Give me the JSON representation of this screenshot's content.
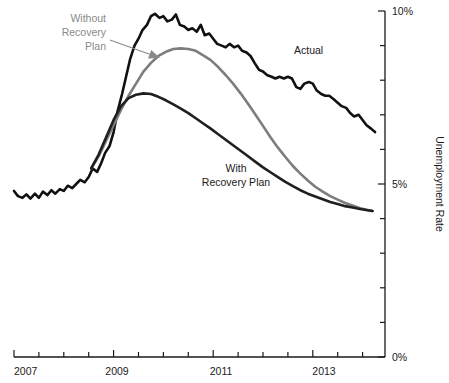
{
  "chart_data": {
    "type": "line",
    "title": "",
    "subtitle": "",
    "xlabel": "",
    "ylabel": "Unemployment Rate",
    "xlim": [
      2007.0,
      2014.45
    ],
    "ylim": [
      0,
      10
    ],
    "grid": false,
    "legend_position": "inline-annotations",
    "y_tick_labels": [
      "0%",
      "5%",
      "10%"
    ],
    "y_ticks_labeled": [
      0,
      5,
      10
    ],
    "y_ticks_minor": [
      1,
      2,
      3,
      4,
      6,
      7,
      8,
      9
    ],
    "x_tick_labels": [
      "2007",
      "2009",
      "2011",
      "2013"
    ],
    "x_ticks_labeled": [
      2007,
      2009,
      2011,
      2013
    ],
    "x_ticks_minor": [
      2007.5,
      2008,
      2008.5,
      2009.5,
      2010,
      2010.5,
      2011.5,
      2012,
      2012.5,
      2013.5,
      2014
    ],
    "series": [
      {
        "name": "Actual",
        "color": "#111111",
        "width": 2.6,
        "label": "Actual",
        "label_x": 2012.1,
        "label_y": 8.9,
        "x": [
          2007.0,
          2007.08,
          2007.17,
          2007.25,
          2007.33,
          2007.42,
          2007.5,
          2007.58,
          2007.67,
          2007.75,
          2007.83,
          2007.92,
          2008.0,
          2008.08,
          2008.17,
          2008.25,
          2008.33,
          2008.42,
          2008.5,
          2008.58,
          2008.67,
          2008.75,
          2008.83,
          2008.92,
          2009.0,
          2009.08,
          2009.17,
          2009.25,
          2009.33,
          2009.42,
          2009.5,
          2009.58,
          2009.67,
          2009.75,
          2009.83,
          2009.92,
          2010.0,
          2010.08,
          2010.17,
          2010.25,
          2010.33,
          2010.42,
          2010.5,
          2010.58,
          2010.67,
          2010.75,
          2010.83,
          2010.92,
          2011.0,
          2011.08,
          2011.17,
          2011.25,
          2011.33,
          2011.42,
          2011.5,
          2011.58,
          2011.67,
          2011.75,
          2011.83,
          2011.92,
          2012.0,
          2012.08,
          2012.17,
          2012.25,
          2012.33,
          2012.42,
          2012.5,
          2012.58,
          2012.67,
          2012.75,
          2012.83,
          2012.92,
          2013.0,
          2013.08,
          2013.17,
          2013.25,
          2013.33,
          2013.42,
          2013.5,
          2013.58,
          2013.67,
          2013.75,
          2013.83,
          2013.92,
          2014.0,
          2014.08,
          2014.17,
          2014.25
        ],
        "y": [
          4.8,
          4.65,
          4.6,
          4.7,
          4.58,
          4.72,
          4.6,
          4.78,
          4.68,
          4.82,
          4.72,
          4.85,
          4.8,
          4.95,
          4.88,
          5.0,
          5.12,
          5.05,
          5.2,
          5.45,
          5.35,
          5.6,
          5.9,
          6.1,
          6.5,
          7.1,
          7.6,
          8.1,
          8.6,
          9.0,
          9.2,
          9.45,
          9.6,
          9.85,
          9.92,
          9.8,
          9.85,
          9.7,
          9.75,
          9.9,
          9.6,
          9.55,
          9.45,
          9.5,
          9.4,
          9.6,
          9.3,
          9.35,
          9.2,
          9.05,
          9.0,
          8.95,
          9.05,
          8.95,
          9.0,
          8.85,
          8.8,
          8.7,
          8.5,
          8.3,
          8.25,
          8.15,
          8.1,
          8.05,
          8.1,
          8.05,
          8.1,
          8.05,
          7.8,
          7.75,
          7.9,
          7.95,
          7.9,
          7.7,
          7.6,
          7.55,
          7.55,
          7.45,
          7.35,
          7.25,
          7.2,
          7.05,
          6.95,
          7.0,
          6.85,
          6.7,
          6.6,
          6.5
        ]
      },
      {
        "name": "Without Recovery Plan",
        "color": "#7d7d7d",
        "width": 2.6,
        "label": "Without\nRecovery\nPlan",
        "label_lines": [
          "Without",
          "Recovery",
          "Plan"
        ],
        "x": [
          2008.55,
          2008.7,
          2008.85,
          2009.0,
          2009.15,
          2009.3,
          2009.45,
          2009.6,
          2009.75,
          2009.9,
          2010.05,
          2010.2,
          2010.35,
          2010.5,
          2010.65,
          2010.8,
          2010.95,
          2011.1,
          2011.25,
          2011.4,
          2011.55,
          2011.7,
          2011.85,
          2012.0,
          2012.15,
          2012.3,
          2012.45,
          2012.6,
          2012.75,
          2012.9,
          2013.05,
          2013.2,
          2013.35,
          2013.5,
          2013.65,
          2013.8,
          2013.95,
          2014.1,
          2014.2
        ],
        "y": [
          5.45,
          5.8,
          6.25,
          6.7,
          7.15,
          7.55,
          7.9,
          8.25,
          8.5,
          8.7,
          8.82,
          8.9,
          8.92,
          8.9,
          8.85,
          8.72,
          8.58,
          8.38,
          8.15,
          7.9,
          7.62,
          7.32,
          7.0,
          6.68,
          6.35,
          6.05,
          5.78,
          5.52,
          5.3,
          5.1,
          4.92,
          4.78,
          4.65,
          4.55,
          4.45,
          4.38,
          4.3,
          4.25,
          4.22
        ]
      },
      {
        "name": "With Recovery Plan",
        "color": "#1f1f1f",
        "width": 2.6,
        "label": "With\nRecovery Plan",
        "label_lines": [
          "With",
          "Recovery Plan"
        ],
        "x": [
          2008.55,
          2008.7,
          2008.85,
          2009.0,
          2009.15,
          2009.3,
          2009.45,
          2009.6,
          2009.75,
          2009.9,
          2010.05,
          2010.2,
          2010.35,
          2010.5,
          2010.65,
          2010.8,
          2010.95,
          2011.1,
          2011.25,
          2011.4,
          2011.55,
          2011.7,
          2011.85,
          2012.0,
          2012.15,
          2012.3,
          2012.45,
          2012.6,
          2012.75,
          2012.9,
          2013.05,
          2013.2,
          2013.35,
          2013.5,
          2013.65,
          2013.8,
          2013.95,
          2014.1,
          2014.2
        ],
        "y": [
          5.45,
          5.85,
          6.35,
          6.85,
          7.25,
          7.48,
          7.58,
          7.62,
          7.6,
          7.52,
          7.42,
          7.3,
          7.18,
          7.05,
          6.9,
          6.75,
          6.6,
          6.44,
          6.28,
          6.12,
          5.96,
          5.8,
          5.64,
          5.48,
          5.34,
          5.2,
          5.06,
          4.94,
          4.82,
          4.72,
          4.64,
          4.56,
          4.48,
          4.42,
          4.36,
          4.32,
          4.28,
          4.24,
          4.22
        ]
      }
    ],
    "annotations": [
      {
        "name": "without-recovery-plan-label",
        "text_lines": [
          "Without",
          "Recovery",
          "Plan"
        ],
        "color": "#8a8a8a",
        "anchor": "end",
        "x_px": 106,
        "y_px": 22,
        "line_height": 14
      },
      {
        "name": "without-recovery-plan-arrow",
        "color": "#8a8a8a",
        "from_px": [
          110,
          40
        ],
        "to_px": [
          160,
          58
        ]
      },
      {
        "name": "actual-label",
        "text_lines": [
          "Actual"
        ],
        "color": "#1a1a1a",
        "anchor": "start",
        "x_px": 294,
        "y_px": 54,
        "line_height": 14
      },
      {
        "name": "with-recovery-plan-label",
        "text_lines": [
          "With",
          "Recovery Plan"
        ],
        "color": "#1a1a1a",
        "anchor": "middle",
        "x_px": 236,
        "y_px": 172,
        "line_height": 14
      }
    ]
  },
  "axis": {
    "y_title": "Unemployment Rate",
    "y_labels": {
      "top": "10%",
      "mid": "5%",
      "bottom": "0%"
    },
    "x_labels": {
      "y2007": "2007",
      "y2009": "2009",
      "y2011": "2011",
      "y2013": "2013"
    }
  }
}
